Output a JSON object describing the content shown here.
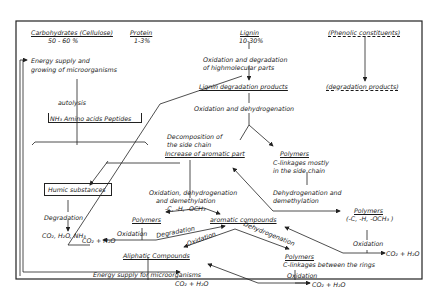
{
  "diagram": {
    "type": "flowchart",
    "sources": {
      "carbohydrates": {
        "label": "Carbohydrates (Cellulose)",
        "percent": "50 - 60 %"
      },
      "protein": {
        "label": "Protein",
        "percent": "1-3%"
      },
      "lignin": {
        "label": "Lignin",
        "percent": "10-30%"
      },
      "phenolic": {
        "label": "(Phenolic constituents)"
      }
    },
    "nodes": {
      "energy_supply_growth": "Energy supply and growing of microorganisms",
      "autolysis": "autolysis",
      "amino": "NH₃ Amino acids Peptides",
      "humic": "Humic substances",
      "degradation_label": "Degradation",
      "co2_h2o_nh3": "CO₂, H₂O, NH₃",
      "oxid_degrad_1": "Oxidation and degradation",
      "oxid_degrad_2": "of highmolecular parts",
      "lignin_products": "Lignin degradation products",
      "degradation_products": "(degradation products)",
      "oxid_dehydro": "Oxidation and dehydrogenation",
      "decomp_1": "Decomposition of",
      "decomp_2": "the side chain",
      "increase_aromatic": "Increase of aromatic part",
      "polymers_side": "Polymers",
      "clink_side_1": "C-linkages mostly",
      "clink_side_2": "in the side chain",
      "oxdehy_demeth_1": "Oxidation, dehydrogenation",
      "oxdehy_demeth_2": "and demethylation",
      "groups_1": "-C, -H, -OCH₃",
      "dehy_demeth_1": "Dehydrogenation and",
      "dehy_demeth_2": "demethylation",
      "polymers_right": "Polymers",
      "groups_right": "(-C, -H, -OCH₃ )",
      "oxidation_right": "Oxidation",
      "co2_right": "CO₂ + H₂O",
      "polymers_left": "Polymers",
      "oxidation_left": "Oxidation",
      "co2_left": "CO₂ + H₂O",
      "degradation_mid": "Degradation",
      "aromatic": "aromatic compounds",
      "oxidation_mid": "Oxidation",
      "dehydrogenation_mid": "Dehydrogenation",
      "aliphatic": "Aliphatic Compounds",
      "energy_micro": "Energy supply for microorganisms",
      "co2_bottom": "CO₂ + H₂O",
      "polymers_rings": "Polymers",
      "clink_rings": "C-linkages between the rings",
      "oxidation_rings": "Oxidation",
      "co2_rings": "CO₂ + H₂O"
    }
  }
}
